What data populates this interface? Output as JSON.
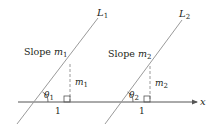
{
  "diagram": {
    "axis_label": "x",
    "line1": {
      "name": "L",
      "index": "1",
      "slope_text": "Slope",
      "slope_var": "m",
      "slope_index": "1",
      "rise_var": "m",
      "rise_index": "1",
      "angle_var": "θ",
      "angle_index": "1",
      "run_label": "1"
    },
    "line2": {
      "name": "L",
      "index": "2",
      "slope_text": "Slope",
      "slope_var": "m",
      "slope_index": "2",
      "rise_var": "m",
      "rise_index": "2",
      "angle_var": "θ",
      "angle_index": "2",
      "run_label": "1"
    },
    "colors": {
      "lines": "#9a9a9a",
      "axis": "#555555",
      "text": "#231f20",
      "dashed": "#9a9a9a"
    }
  }
}
